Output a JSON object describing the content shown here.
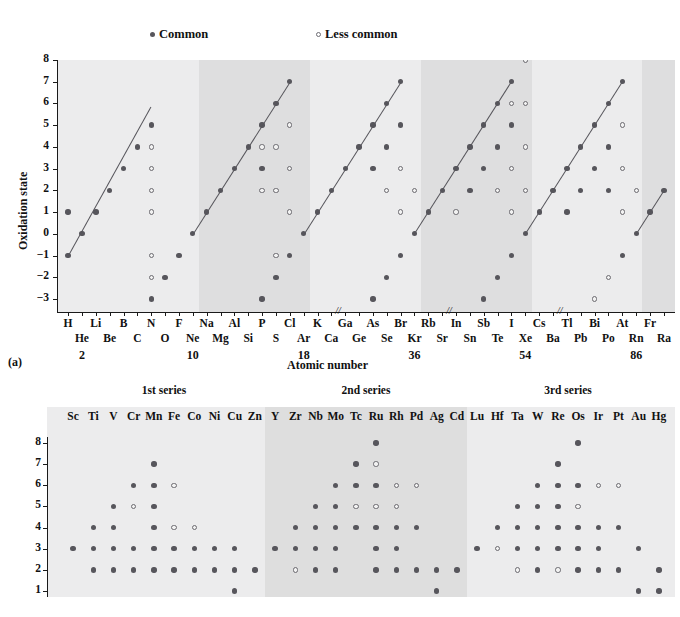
{
  "legend": {
    "common_label": "Common",
    "less_common_label": "Less common",
    "common_color": "#57565c",
    "less_common_color": "#6b6a70"
  },
  "panel_a": {
    "tag": "(a)",
    "ylabel": "Oxidation state",
    "xlabel": "Atomic number",
    "yticks": [
      "8",
      "7",
      "6",
      "5",
      "4",
      "3",
      "2",
      "1",
      "0",
      "-1",
      "-2",
      "-3"
    ],
    "ylim": [
      -3.6,
      8
    ],
    "elements_top": [
      "H",
      "Li",
      "B",
      "N",
      "F",
      "Na",
      "Al",
      "P",
      "Cl",
      "K",
      "Ga",
      "As",
      "Br",
      "Rb",
      "In",
      "Sb",
      "I",
      "Cs",
      "Tl",
      "Bi",
      "At",
      "Fr"
    ],
    "elements_bottom": [
      "He",
      "Be",
      "C",
      "O",
      "Ne",
      "Mg",
      "Si",
      "S",
      "Ar",
      "Ca",
      "Ge",
      "Se",
      "Kr",
      "Sr",
      "Sn",
      "Te",
      "Xe",
      "Ba",
      "Pb",
      "Po",
      "Rn",
      "Ra"
    ],
    "group_numbers": [
      "2",
      "10",
      "18",
      "36",
      "54",
      "86"
    ],
    "break_marker": "//",
    "band_shades": [
      "#ececed",
      "#dededf",
      "#ececed",
      "#dededf",
      "#ececed",
      "#dededf"
    ]
  },
  "panel_b": {
    "ylabel": "Oxidation state",
    "yticks": [
      "8",
      "7",
      "6",
      "5",
      "4",
      "3",
      "2",
      "1"
    ],
    "ylim": [
      0.55,
      8.2
    ],
    "series_titles": [
      "1st series",
      "2nd series",
      "3rd series"
    ],
    "band_shades": [
      "#ececed",
      "#dedede",
      "#ececed"
    ],
    "elements": [
      "Sc",
      "Ti",
      "V",
      "Cr",
      "Mn",
      "Fe",
      "Co",
      "Ni",
      "Cu",
      "Zn",
      "Y",
      "Zr",
      "Nb",
      "Mo",
      "Tc",
      "Ru",
      "Rh",
      "Pd",
      "Ag",
      "Cd",
      "Lu",
      "Hf",
      "Ta",
      "W",
      "Re",
      "Os",
      "Ir",
      "Pt",
      "Au",
      "Hg"
    ]
  },
  "chart_data": [
    {
      "type": "scatter",
      "id": "panel-a-main-group",
      "title": "",
      "xlabel": "Atomic number",
      "ylabel": "Oxidation state",
      "ylim": [
        -3.6,
        8
      ],
      "grid": false,
      "legend": [
        "Common",
        "Less common"
      ],
      "legend_position": "top",
      "categories": [
        "H",
        "He",
        "Li",
        "Be",
        "B",
        "C",
        "N",
        "O",
        "F",
        "Ne",
        "Na",
        "Mg",
        "Al",
        "Si",
        "P",
        "S",
        "Cl",
        "Ar",
        "K",
        "Ca",
        "Ga",
        "Ge",
        "As",
        "Se",
        "Br",
        "Kr",
        "Rb",
        "Sr",
        "In",
        "Sn",
        "Sb",
        "Te",
        "I",
        "Xe",
        "Cs",
        "Ba",
        "Tl",
        "Pb",
        "Bi",
        "Po",
        "At",
        "Rn",
        "Fr",
        "Ra"
      ],
      "points": [
        {
          "el": "H",
          "common": [
            1,
            -1
          ],
          "less": []
        },
        {
          "el": "He",
          "common": [
            0
          ],
          "less": []
        },
        {
          "el": "Li",
          "common": [
            1
          ],
          "less": []
        },
        {
          "el": "Be",
          "common": [
            2
          ],
          "less": []
        },
        {
          "el": "B",
          "common": [
            3
          ],
          "less": []
        },
        {
          "el": "C",
          "common": [
            4
          ],
          "less": []
        },
        {
          "el": "N",
          "common": [
            5,
            -3
          ],
          "less": [
            4,
            3,
            2,
            1,
            -1,
            -2
          ]
        },
        {
          "el": "O",
          "common": [
            -2
          ],
          "less": []
        },
        {
          "el": "F",
          "common": [
            -1
          ],
          "less": []
        },
        {
          "el": "Ne",
          "common": [
            0
          ],
          "less": []
        },
        {
          "el": "Na",
          "common": [
            1
          ],
          "less": []
        },
        {
          "el": "Mg",
          "common": [
            2
          ],
          "less": []
        },
        {
          "el": "Al",
          "common": [
            3
          ],
          "less": []
        },
        {
          "el": "Si",
          "common": [
            4,
            -4
          ],
          "less": []
        },
        {
          "el": "P",
          "common": [
            5,
            3,
            -3
          ],
          "less": [
            4,
            2
          ]
        },
        {
          "el": "S",
          "common": [
            6,
            -2
          ],
          "less": [
            4,
            2,
            -1
          ]
        },
        {
          "el": "Cl",
          "common": [
            7,
            -1
          ],
          "less": [
            5,
            3,
            1
          ]
        },
        {
          "el": "Ar",
          "common": [
            0
          ],
          "less": []
        },
        {
          "el": "K",
          "common": [
            1
          ],
          "less": []
        },
        {
          "el": "Ca",
          "common": [
            2
          ],
          "less": []
        },
        {
          "el": "Ga",
          "common": [
            3
          ],
          "less": []
        },
        {
          "el": "Ge",
          "common": [
            4,
            -4
          ],
          "less": []
        },
        {
          "el": "As",
          "common": [
            5,
            3,
            -3
          ],
          "less": []
        },
        {
          "el": "Se",
          "common": [
            6,
            4,
            -2
          ],
          "less": [
            2
          ]
        },
        {
          "el": "Br",
          "common": [
            7,
            5,
            -1
          ],
          "less": [
            3,
            1
          ]
        },
        {
          "el": "Kr",
          "common": [
            0
          ],
          "less": [
            2
          ]
        },
        {
          "el": "Rb",
          "common": [
            1
          ],
          "less": []
        },
        {
          "el": "Sr",
          "common": [
            2
          ],
          "less": []
        },
        {
          "el": "In",
          "common": [
            3
          ],
          "less": [
            1
          ]
        },
        {
          "el": "Sn",
          "common": [
            4,
            2
          ],
          "less": [
            -4
          ]
        },
        {
          "el": "Sb",
          "common": [
            5,
            3,
            -3
          ],
          "less": []
        },
        {
          "el": "Te",
          "common": [
            6,
            4,
            -2
          ],
          "less": [
            2
          ]
        },
        {
          "el": "I",
          "common": [
            7,
            5,
            -1
          ],
          "less": [
            6,
            3,
            1
          ]
        },
        {
          "el": "Xe",
          "common": [
            0
          ],
          "less": [
            8,
            6,
            4,
            2
          ]
        },
        {
          "el": "Cs",
          "common": [
            1
          ],
          "less": []
        },
        {
          "el": "Ba",
          "common": [
            2
          ],
          "less": []
        },
        {
          "el": "Tl",
          "common": [
            3,
            1
          ],
          "less": []
        },
        {
          "el": "Pb",
          "common": [
            4,
            2
          ],
          "less": []
        },
        {
          "el": "Bi",
          "common": [
            5,
            3
          ],
          "less": [
            -3
          ]
        },
        {
          "el": "Po",
          "common": [
            6,
            4,
            2
          ],
          "less": [
            -2
          ]
        },
        {
          "el": "At",
          "common": [
            7,
            -1
          ],
          "less": [
            5,
            3,
            1
          ]
        },
        {
          "el": "Rn",
          "common": [
            0
          ],
          "less": [
            2
          ]
        },
        {
          "el": "Fr",
          "common": [
            1
          ],
          "less": []
        },
        {
          "el": "Ra",
          "common": [
            2
          ],
          "less": []
        }
      ],
      "trend_lines_note": "Diagonal lines connect the maximum common oxidation state rising across each period"
    },
    {
      "type": "scatter",
      "id": "panel-b-transition-metals",
      "title": "",
      "xlabel": "",
      "ylabel": "Oxidation state",
      "ylim": [
        0.55,
        8.2
      ],
      "grid": false,
      "series_groups": [
        "1st series",
        "2nd series",
        "3rd series"
      ],
      "points": [
        {
          "el": "Sc",
          "common": [
            3
          ],
          "less": []
        },
        {
          "el": "Ti",
          "common": [
            2,
            3,
            4
          ],
          "less": []
        },
        {
          "el": "V",
          "common": [
            2,
            3,
            4,
            5
          ],
          "less": []
        },
        {
          "el": "Cr",
          "common": [
            2,
            3,
            6
          ],
          "less": [
            5
          ]
        },
        {
          "el": "Mn",
          "common": [
            2,
            3,
            4,
            5,
            6,
            7
          ],
          "less": []
        },
        {
          "el": "Fe",
          "common": [
            2,
            3
          ],
          "less": [
            4,
            6
          ]
        },
        {
          "el": "Co",
          "common": [
            2,
            3
          ],
          "less": [
            4
          ]
        },
        {
          "el": "Ni",
          "common": [
            2,
            3
          ],
          "less": []
        },
        {
          "el": "Cu",
          "common": [
            1,
            2,
            3
          ],
          "less": []
        },
        {
          "el": "Zn",
          "common": [
            2
          ],
          "less": []
        },
        {
          "el": "Y",
          "common": [
            3
          ],
          "less": []
        },
        {
          "el": "Zr",
          "common": [
            3,
            4
          ],
          "less": [
            2
          ]
        },
        {
          "el": "Nb",
          "common": [
            2,
            3,
            4,
            5
          ],
          "less": []
        },
        {
          "el": "Mo",
          "common": [
            2,
            3,
            4,
            5,
            6
          ],
          "less": []
        },
        {
          "el": "Tc",
          "common": [
            4,
            6,
            7
          ],
          "less": [
            5
          ]
        },
        {
          "el": "Ru",
          "common": [
            2,
            3,
            4,
            6,
            8
          ],
          "less": [
            5,
            7
          ]
        },
        {
          "el": "Rh",
          "common": [
            2,
            3,
            4
          ],
          "less": [
            5,
            6
          ]
        },
        {
          "el": "Pd",
          "common": [
            2,
            4
          ],
          "less": [
            6
          ]
        },
        {
          "el": "Ag",
          "common": [
            1,
            2
          ],
          "less": []
        },
        {
          "el": "Cd",
          "common": [
            2
          ],
          "less": []
        },
        {
          "el": "Lu",
          "common": [
            3
          ],
          "less": []
        },
        {
          "el": "Hf",
          "common": [
            4
          ],
          "less": [
            3
          ]
        },
        {
          "el": "Ta",
          "common": [
            3,
            4,
            5
          ],
          "less": [
            2
          ]
        },
        {
          "el": "W",
          "common": [
            2,
            3,
            4,
            5,
            6
          ],
          "less": []
        },
        {
          "el": "Re",
          "common": [
            3,
            4,
            5,
            6,
            7
          ],
          "less": [
            2
          ]
        },
        {
          "el": "Os",
          "common": [
            2,
            3,
            4,
            6,
            8
          ],
          "less": [
            5
          ]
        },
        {
          "el": "Ir",
          "common": [
            2,
            3,
            4
          ],
          "less": [
            6
          ]
        },
        {
          "el": "Pt",
          "common": [
            2,
            4
          ],
          "less": [
            6
          ]
        },
        {
          "el": "Au",
          "common": [
            1,
            3
          ],
          "less": []
        },
        {
          "el": "Hg",
          "common": [
            1,
            2
          ],
          "less": []
        }
      ]
    }
  ]
}
